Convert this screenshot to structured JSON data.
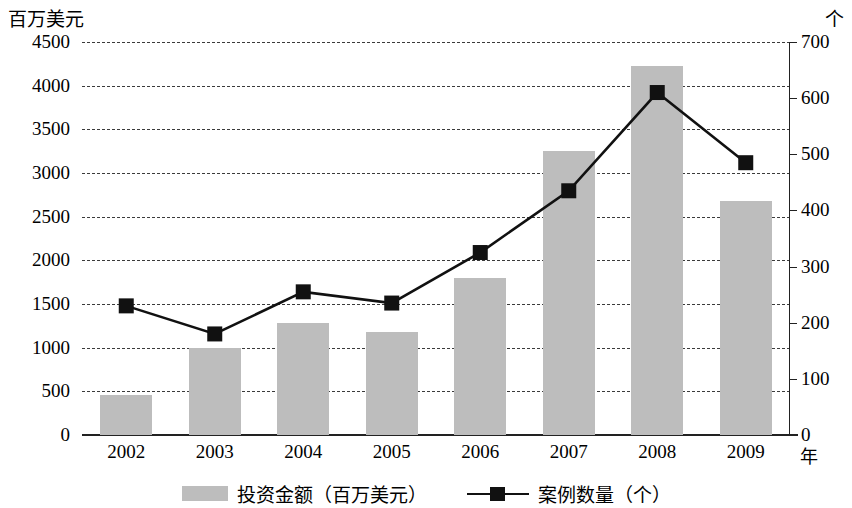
{
  "axis": {
    "left_unit": "百万美元",
    "right_unit": "个",
    "x_unit": "年",
    "left_ticks": [
      "4500",
      "4000",
      "3500",
      "3000",
      "2500",
      "2000",
      "1500",
      "1000",
      "500",
      "0"
    ],
    "right_ticks": [
      "700",
      "600",
      "500",
      "400",
      "300",
      "200",
      "100",
      "0"
    ]
  },
  "legend": {
    "bar_label": "投资金额（百万美元）",
    "line_label": "案例数量（个）",
    "bar_swatch": "bar-swatch",
    "line_swatch": "line-marker-swatch"
  },
  "chart_data": {
    "type": "bar",
    "title": "",
    "subtitle": "",
    "xlabel": "年",
    "ylabel": "百万美元",
    "y2label": "个",
    "categories": [
      "2002",
      "2003",
      "2004",
      "2005",
      "2006",
      "2007",
      "2008",
      "2009"
    ],
    "ylim": [
      0,
      4500
    ],
    "y2lim": [
      0,
      700
    ],
    "ytick_step": 500,
    "y2tick_step": 100,
    "grid": true,
    "grid_style": "dashed-horizontal",
    "legend_position": "bottom-center",
    "colors": {
      "bar_fill": "#bdbdbd",
      "line": "#111111",
      "marker": "#111111",
      "grid": "#3b3b3b",
      "axis": "#222222"
    },
    "series": [
      {
        "name": "投资金额（百万美元）",
        "type": "bar",
        "axis": "left",
        "values": [
          460,
          1000,
          1280,
          1180,
          1800,
          3250,
          4220,
          2680
        ]
      },
      {
        "name": "案例数量（个）",
        "type": "line",
        "axis": "right",
        "marker": "square",
        "values": [
          230,
          180,
          255,
          235,
          325,
          435,
          610,
          485
        ]
      }
    ]
  }
}
